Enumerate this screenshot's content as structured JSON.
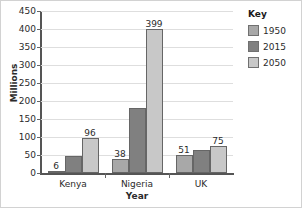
{
  "chart_data": {
    "type": "bar",
    "title": "",
    "categories": [
      "Kenya",
      "Nigeria",
      "UK"
    ],
    "series": [
      {
        "name": "1950",
        "color": "#a8a8a8",
        "values": [
          6,
          38,
          51
        ]
      },
      {
        "name": "2015",
        "color": "#808080",
        "values": [
          46,
          180,
          64
        ]
      },
      {
        "name": "2050",
        "color": "#c8c8c8",
        "values": [
          96,
          399,
          75
        ]
      }
    ],
    "data_labels": [
      [
        "6",
        "",
        "96"
      ],
      [
        "38",
        "",
        "399"
      ],
      [
        "51",
        "",
        "75"
      ]
    ],
    "xlabel": "Year",
    "ylabel": "Millions",
    "ylim": [
      0,
      450
    ],
    "ytick_step": 50,
    "yticks": [
      "450",
      "400",
      "350",
      "300",
      "250",
      "200",
      "150",
      "100",
      "50",
      "0"
    ],
    "grid": true,
    "legend_position": "right"
  },
  "legend": {
    "title": "Key",
    "items": [
      {
        "label": "1950",
        "color": "#a8a8a8"
      },
      {
        "label": "2015",
        "color": "#808080"
      },
      {
        "label": "2050",
        "color": "#c8c8c8"
      }
    ]
  },
  "axes": {
    "x_title": "Year",
    "y_title": "Millions"
  }
}
